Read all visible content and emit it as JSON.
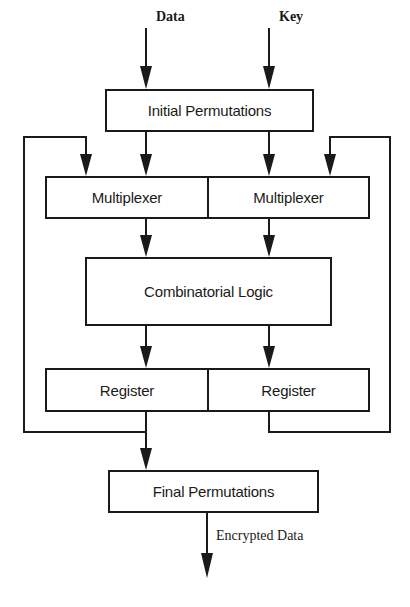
{
  "diagram": {
    "type": "block-flow",
    "inputs": {
      "data": "Data",
      "key": "Key"
    },
    "blocks": {
      "initial_permutations": "Initial Permutations",
      "multiplexer_left": "Multiplexer",
      "multiplexer_right": "Multiplexer",
      "combinatorial_logic": "Combinatorial Logic",
      "register_left": "Register",
      "register_right": "Register",
      "final_permutations": "Final Permutations"
    },
    "outputs": {
      "encrypted_data": "Encrypted Data"
    },
    "edges": [
      {
        "from": "Data",
        "to": "Initial Permutations"
      },
      {
        "from": "Key",
        "to": "Initial Permutations"
      },
      {
        "from": "Initial Permutations",
        "to": "Multiplexer (left)"
      },
      {
        "from": "Initial Permutations",
        "to": "Multiplexer (right)"
      },
      {
        "from": "Multiplexer (left)",
        "to": "Combinatorial Logic"
      },
      {
        "from": "Multiplexer (right)",
        "to": "Combinatorial Logic"
      },
      {
        "from": "Combinatorial Logic",
        "to": "Register (left)"
      },
      {
        "from": "Combinatorial Logic",
        "to": "Register (right)"
      },
      {
        "from": "Register (left)",
        "to": "Multiplexer (left)",
        "kind": "feedback"
      },
      {
        "from": "Register (right)",
        "to": "Multiplexer (right)",
        "kind": "feedback"
      },
      {
        "from": "Register (left)",
        "to": "Final Permutations"
      },
      {
        "from": "Final Permutations",
        "to": "Encrypted Data"
      }
    ],
    "colors": {
      "ink": "#1a1a1a",
      "background": "#ffffff"
    }
  }
}
